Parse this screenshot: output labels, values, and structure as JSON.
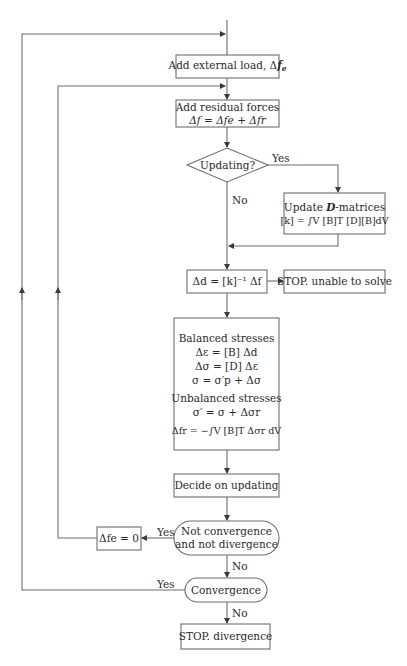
{
  "diagram": {
    "nodes": {
      "add_external_load": {
        "text": "Add external load, Δ",
        "var": "f",
        "sub": "e"
      },
      "add_residual_forces": {
        "line1": "Add residual forces",
        "line2": "Δf = Δfe + Δfr"
      },
      "updating_decision": {
        "text": "Updating?"
      },
      "update_d_matrices": {
        "line1_pre": "Update ",
        "line1_var": "D",
        "line1_post": "-matrices",
        "line2": "[k] = ∫V [B]T [D][B]dV"
      },
      "solve_displacement": {
        "text": "Δd = [k]⁻¹ Δf"
      },
      "stop_unable": {
        "text": "STOP. unable to solve"
      },
      "stresses_block": {
        "heading1": "Balanced stresses",
        "eq1": "Δε = [B] Δd",
        "eq2": "Δσ = [D] Δε",
        "eq3": "σ = σ′p + Δσ",
        "heading2": "Unbalanced stresses",
        "eq4": "σ′ = σ + Δσr",
        "eq5": "Δfr = −∫V [B]T Δσr dV"
      },
      "decide_updating": {
        "text": "Decide on updating"
      },
      "not_conv_not_div": {
        "line1": "Not convergence",
        "line2": "and not divergence"
      },
      "reset_external_load": {
        "text": "Δfe = 0"
      },
      "convergence": {
        "text": "Convergence"
      },
      "stop_divergence": {
        "text": "STOP. divergence"
      }
    },
    "edge_labels": {
      "updating_yes": "Yes",
      "updating_no": "No",
      "not_conv_yes": "Yes",
      "not_conv_no": "No",
      "convergence_yes": "Yes",
      "convergence_no": "No"
    },
    "colors": {
      "line": "#6e6e6e",
      "text": "#2a2a2a",
      "background": "#ffffff"
    }
  }
}
